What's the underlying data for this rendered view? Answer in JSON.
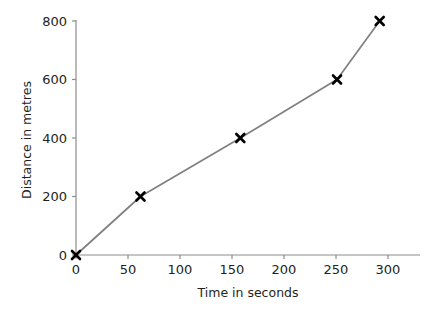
{
  "chart_data": {
    "type": "line",
    "title": "",
    "subtitle": "",
    "xlabel": "Time in seconds",
    "ylabel": "Distance in metres",
    "xlim": [
      0,
      310
    ],
    "ylim": [
      0,
      850
    ],
    "xticks": [
      0,
      50,
      100,
      150,
      200,
      250,
      300
    ],
    "yticks": [
      0,
      200,
      400,
      600,
      800
    ],
    "xtick_labels": [
      "0",
      "50",
      "100",
      "150",
      "200",
      "250",
      "300"
    ],
    "ytick_labels": [
      "0",
      "200",
      "400",
      "600",
      "800"
    ],
    "grid": false,
    "legend": null,
    "annotations": [],
    "series": [
      {
        "name": "Distance travelled",
        "marker": "x",
        "marker_color": "#000000",
        "line_color": "#808080",
        "x": [
          0,
          62,
          158,
          251,
          292
        ],
        "y": [
          0,
          200,
          400,
          600,
          800
        ],
        "points": [
          {
            "x": 0,
            "y": 0
          },
          {
            "x": 62,
            "y": 200
          },
          {
            "x": 158,
            "y": 400
          },
          {
            "x": 251,
            "y": 600
          },
          {
            "x": 292,
            "y": 800
          }
        ]
      }
    ]
  },
  "axes": {
    "axis_color": "#8c8c8c",
    "text_color": "#231f20",
    "background": "#ffffff"
  }
}
